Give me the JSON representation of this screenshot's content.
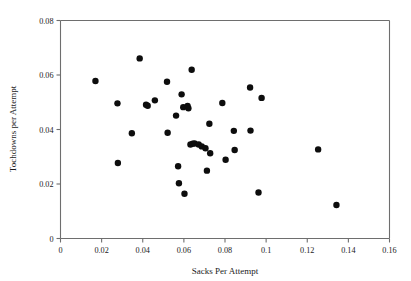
{
  "chart_data": {
    "type": "scatter",
    "title": "",
    "xlabel": "Sacks Per Attempt",
    "ylabel": "Tochdowns per Attempt",
    "xlim": [
      0,
      0.16
    ],
    "ylim": [
      0,
      0.08
    ],
    "xticks": [
      0,
      0.02,
      0.04,
      0.06,
      0.08,
      0.1,
      0.12,
      0.14,
      0.16
    ],
    "xticklabels": [
      "0",
      "0.02",
      "0.04",
      "0.06",
      "0.08",
      "0.1",
      "0.12",
      "0.14",
      "0.16"
    ],
    "yticks": [
      0,
      0.02,
      0.04,
      0.06,
      0.08
    ],
    "yticklabels": [
      "0",
      "0.02",
      "0.04",
      "0.06",
      "0.08"
    ],
    "grid": false,
    "legend": null,
    "marker": "filled-circle",
    "marker_color": "#0d0d0d",
    "marker_size": 3.2,
    "n_points": 41,
    "points": [
      {
        "x": 0.017,
        "y": 0.0578
      },
      {
        "x": 0.0277,
        "y": 0.0496
      },
      {
        "x": 0.0279,
        "y": 0.0277
      },
      {
        "x": 0.0347,
        "y": 0.0386
      },
      {
        "x": 0.0385,
        "y": 0.0661
      },
      {
        "x": 0.0416,
        "y": 0.0491
      },
      {
        "x": 0.0424,
        "y": 0.0487
      },
      {
        "x": 0.0459,
        "y": 0.0507
      },
      {
        "x": 0.0518,
        "y": 0.0575
      },
      {
        "x": 0.0521,
        "y": 0.0388
      },
      {
        "x": 0.0562,
        "y": 0.0451
      },
      {
        "x": 0.0572,
        "y": 0.0265
      },
      {
        "x": 0.0576,
        "y": 0.0203
      },
      {
        "x": 0.0589,
        "y": 0.0529
      },
      {
        "x": 0.0597,
        "y": 0.0482
      },
      {
        "x": 0.0603,
        "y": 0.0164
      },
      {
        "x": 0.0618,
        "y": 0.0486
      },
      {
        "x": 0.0622,
        "y": 0.0478
      },
      {
        "x": 0.0632,
        "y": 0.0345
      },
      {
        "x": 0.0638,
        "y": 0.0619
      },
      {
        "x": 0.0643,
        "y": 0.0348
      },
      {
        "x": 0.0652,
        "y": 0.0349
      },
      {
        "x": 0.0672,
        "y": 0.0345
      },
      {
        "x": 0.0687,
        "y": 0.0338
      },
      {
        "x": 0.0705,
        "y": 0.0331
      },
      {
        "x": 0.0712,
        "y": 0.0249
      },
      {
        "x": 0.0724,
        "y": 0.0421
      },
      {
        "x": 0.0728,
        "y": 0.0313
      },
      {
        "x": 0.0787,
        "y": 0.0497
      },
      {
        "x": 0.0803,
        "y": 0.0289
      },
      {
        "x": 0.0843,
        "y": 0.0395
      },
      {
        "x": 0.0847,
        "y": 0.0325
      },
      {
        "x": 0.0922,
        "y": 0.0554
      },
      {
        "x": 0.0924,
        "y": 0.0396
      },
      {
        "x": 0.0963,
        "y": 0.0169
      },
      {
        "x": 0.0978,
        "y": 0.0516
      },
      {
        "x": 0.1253,
        "y": 0.0327
      },
      {
        "x": 0.1342,
        "y": 0.0123
      }
    ]
  }
}
